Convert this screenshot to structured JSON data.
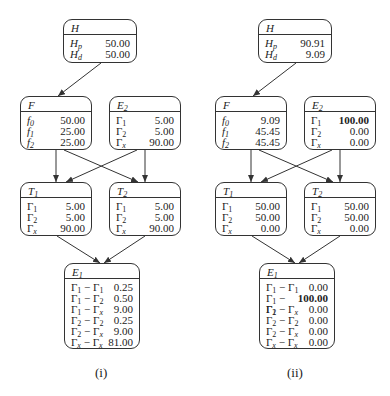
{
  "panels": [
    {
      "caption": "(i)",
      "nodes": {
        "H": {
          "title": "H",
          "rows": [
            {
              "k": "Hp",
              "v": "50.00"
            },
            {
              "k": "Hd",
              "v": "50.00"
            }
          ]
        },
        "F": {
          "title": "F",
          "rows": [
            {
              "k": "f0",
              "v": "50.00"
            },
            {
              "k": "f1",
              "v": "25.00"
            },
            {
              "k": "f2",
              "v": "25.00"
            }
          ]
        },
        "E2": {
          "title": "E2",
          "rows": [
            {
              "k": "Γ1",
              "v": "5.00"
            },
            {
              "k": "Γ2",
              "v": "5.00"
            },
            {
              "k": "Γx",
              "v": "90.00"
            }
          ]
        },
        "T1": {
          "title": "T1",
          "rows": [
            {
              "k": "Γ1",
              "v": "5.00"
            },
            {
              "k": "Γ2",
              "v": "5.00"
            },
            {
              "k": "Γx",
              "v": "90.00"
            }
          ]
        },
        "T2": {
          "title": "T2",
          "rows": [
            {
              "k": "Γ1",
              "v": "5.00"
            },
            {
              "k": "Γ2",
              "v": "5.00"
            },
            {
              "k": "Γx",
              "v": "90.00"
            }
          ]
        },
        "E1": {
          "title": "E1",
          "rows": [
            {
              "k": "Γ1 − Γ1",
              "v": "0.25"
            },
            {
              "k": "Γ1 − Γ2",
              "v": "0.50"
            },
            {
              "k": "Γ1 − Γx",
              "v": "9.00"
            },
            {
              "k": "Γ2 − Γ2",
              "v": "0.25"
            },
            {
              "k": "Γ2 − Γx",
              "v": "9.00"
            },
            {
              "k": "Γx − Γx",
              "v": "81.00"
            }
          ]
        }
      },
      "bold": []
    },
    {
      "caption": "(ii)",
      "nodes": {
        "H": {
          "title": "H",
          "rows": [
            {
              "k": "Hp",
              "v": "90.91"
            },
            {
              "k": "Hd",
              "v": "9.09"
            }
          ]
        },
        "F": {
          "title": "F",
          "rows": [
            {
              "k": "f0",
              "v": "9.09"
            },
            {
              "k": "f1",
              "v": "45.45"
            },
            {
              "k": "f2",
              "v": "45.45"
            }
          ]
        },
        "E2": {
          "title": "E2",
          "rows": [
            {
              "k": "Γ1",
              "v": "100.00"
            },
            {
              "k": "Γ2",
              "v": "0.00"
            },
            {
              "k": "Γx",
              "v": "0.00"
            }
          ]
        },
        "T1": {
          "title": "T1",
          "rows": [
            {
              "k": "Γ1",
              "v": "50.00"
            },
            {
              "k": "Γ2",
              "v": "50.00"
            },
            {
              "k": "Γx",
              "v": "0.00"
            }
          ]
        },
        "T2": {
          "title": "T2",
          "rows": [
            {
              "k": "Γ1",
              "v": "50.00"
            },
            {
              "k": "Γ2",
              "v": "50.00"
            },
            {
              "k": "Γx",
              "v": "0.00"
            }
          ]
        },
        "E1": {
          "title": "E1",
          "rows": [
            {
              "k": "Γ1 − Γ1",
              "v": "0.00"
            },
            {
              "k": "Γ1 − Γ2",
              "v": "100.00"
            },
            {
              "k": "Γ1 − Γx",
              "v": "0.00"
            },
            {
              "k": "Γ2 − Γ2",
              "v": "0.00"
            },
            {
              "k": "Γ2 − Γx",
              "v": "0.00"
            },
            {
              "k": "Γx − Γx",
              "v": "0.00"
            }
          ]
        }
      },
      "bold": [
        "E2.0",
        "E1.1"
      ]
    }
  ],
  "edges": [
    {
      "from": "H",
      "to": "F"
    },
    {
      "from": "F",
      "to": "T1"
    },
    {
      "from": "F",
      "to": "T2"
    },
    {
      "from": "E2",
      "to": "T1"
    },
    {
      "from": "E2",
      "to": "T2"
    },
    {
      "from": "T1",
      "to": "E1"
    },
    {
      "from": "T2",
      "to": "E1"
    }
  ]
}
